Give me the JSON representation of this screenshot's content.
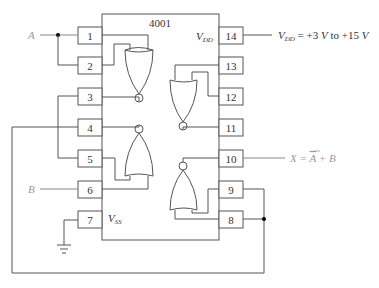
{
  "chip": {
    "part_number": "4001"
  },
  "pins": {
    "p1": "1",
    "p2": "2",
    "p3": "3",
    "p4": "4",
    "p5": "5",
    "p6": "6",
    "p7": "7",
    "p8": "8",
    "p9": "9",
    "p10": "10",
    "p11": "11",
    "p12": "12",
    "p13": "13",
    "p14": "14"
  },
  "labels": {
    "vdd_inside": "V",
    "vdd_sub": "DD",
    "vss_inside": "V",
    "vss_sub": "SS",
    "input_a": "A",
    "input_b": "B",
    "supply_v": "V",
    "supply_sub": "DD",
    "supply_rest": " = +3 ",
    "supply_v2": "V",
    "supply_to": " to +15 ",
    "supply_v3": "V",
    "output_x": "X",
    "output_eq": " = ",
    "output_abar": "A",
    "output_rest": " + B"
  },
  "colors": {
    "line": "#555555",
    "signal_label": "#999999",
    "junction": "#000000"
  }
}
